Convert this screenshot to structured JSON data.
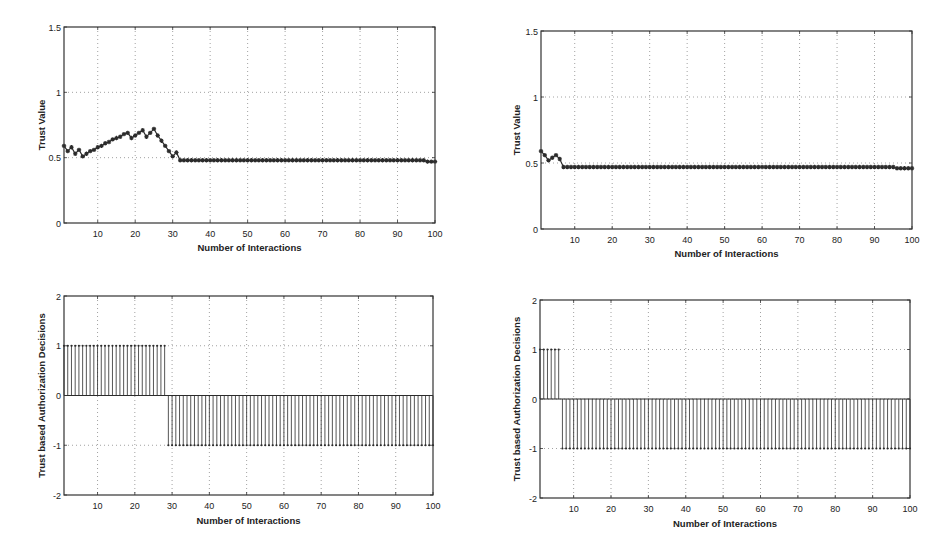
{
  "chart_data": [
    {
      "id": "top_left",
      "type": "line",
      "marker": "asterisk",
      "title": "",
      "xlabel": "Number of Interactions",
      "ylabel": "Trust Value",
      "xlim": [
        1,
        100
      ],
      "ylim": [
        0,
        1.5
      ],
      "xticks": [
        10,
        20,
        30,
        40,
        50,
        60,
        70,
        80,
        90,
        100
      ],
      "yticks": [
        0,
        0.5,
        1,
        1.5
      ],
      "ytick_labels": [
        "0",
        "0.5",
        "1",
        "1.5"
      ],
      "grid": true,
      "x": [
        1,
        2,
        3,
        4,
        5,
        6,
        7,
        8,
        9,
        10,
        11,
        12,
        13,
        14,
        15,
        16,
        17,
        18,
        19,
        20,
        21,
        22,
        23,
        24,
        25,
        26,
        27,
        28,
        29,
        30,
        31,
        32,
        33,
        34,
        35,
        36,
        37,
        38,
        39,
        40,
        41,
        42,
        43,
        44,
        45,
        46,
        47,
        48,
        49,
        50,
        51,
        52,
        53,
        54,
        55,
        56,
        57,
        58,
        59,
        60,
        61,
        62,
        63,
        64,
        65,
        66,
        67,
        68,
        69,
        70,
        71,
        72,
        73,
        74,
        75,
        76,
        77,
        78,
        79,
        80,
        81,
        82,
        83,
        84,
        85,
        86,
        87,
        88,
        89,
        90,
        91,
        92,
        93,
        94,
        95,
        96,
        97,
        98,
        99,
        100
      ],
      "values": [
        0.59,
        0.55,
        0.58,
        0.53,
        0.56,
        0.51,
        0.53,
        0.55,
        0.56,
        0.58,
        0.59,
        0.61,
        0.62,
        0.64,
        0.65,
        0.66,
        0.68,
        0.69,
        0.65,
        0.67,
        0.69,
        0.71,
        0.66,
        0.69,
        0.72,
        0.67,
        0.63,
        0.59,
        0.55,
        0.51,
        0.54,
        0.48,
        0.48,
        0.48,
        0.48,
        0.48,
        0.48,
        0.48,
        0.48,
        0.48,
        0.48,
        0.48,
        0.48,
        0.48,
        0.48,
        0.48,
        0.48,
        0.48,
        0.48,
        0.48,
        0.48,
        0.48,
        0.48,
        0.48,
        0.48,
        0.48,
        0.48,
        0.48,
        0.48,
        0.48,
        0.48,
        0.48,
        0.48,
        0.48,
        0.48,
        0.48,
        0.48,
        0.48,
        0.48,
        0.48,
        0.48,
        0.48,
        0.48,
        0.48,
        0.48,
        0.48,
        0.48,
        0.48,
        0.48,
        0.48,
        0.48,
        0.48,
        0.48,
        0.48,
        0.48,
        0.48,
        0.48,
        0.48,
        0.48,
        0.48,
        0.48,
        0.48,
        0.48,
        0.48,
        0.48,
        0.48,
        0.48,
        0.47,
        0.47,
        0.47
      ]
    },
    {
      "id": "top_right",
      "type": "line",
      "marker": "asterisk",
      "title": "",
      "xlabel": "Number of Interactions",
      "ylabel": "Trust Value",
      "xlim": [
        1,
        100
      ],
      "ylim": [
        0,
        1.5
      ],
      "xticks": [
        10,
        20,
        30,
        40,
        50,
        60,
        70,
        80,
        90,
        100
      ],
      "yticks": [
        0,
        0.5,
        1,
        1.5
      ],
      "ytick_labels": [
        "0",
        "0.5",
        "1",
        "1.5"
      ],
      "grid": true,
      "values": [
        0.59,
        0.56,
        0.52,
        0.54,
        0.56,
        0.53,
        0.47,
        0.47,
        0.47,
        0.47,
        0.47,
        0.47,
        0.47,
        0.47,
        0.47,
        0.47,
        0.47,
        0.47,
        0.47,
        0.47,
        0.47,
        0.47,
        0.47,
        0.47,
        0.47,
        0.47,
        0.47,
        0.47,
        0.47,
        0.47,
        0.47,
        0.47,
        0.47,
        0.47,
        0.47,
        0.47,
        0.47,
        0.47,
        0.47,
        0.47,
        0.47,
        0.47,
        0.47,
        0.47,
        0.47,
        0.47,
        0.47,
        0.47,
        0.47,
        0.47,
        0.47,
        0.47,
        0.47,
        0.47,
        0.47,
        0.47,
        0.47,
        0.47,
        0.47,
        0.47,
        0.47,
        0.47,
        0.47,
        0.47,
        0.47,
        0.47,
        0.47,
        0.47,
        0.47,
        0.47,
        0.47,
        0.47,
        0.47,
        0.47,
        0.47,
        0.47,
        0.47,
        0.47,
        0.47,
        0.47,
        0.47,
        0.47,
        0.47,
        0.47,
        0.47,
        0.47,
        0.47,
        0.47,
        0.47,
        0.47,
        0.47,
        0.47,
        0.47,
        0.47,
        0.47,
        0.46,
        0.46,
        0.46,
        0.46,
        0.46
      ]
    },
    {
      "id": "bottom_left",
      "type": "stem",
      "title": "",
      "xlabel": "Number of Interactions",
      "ylabel": "Trust based Authorization Decisions",
      "xlim": [
        1,
        100
      ],
      "ylim": [
        -2,
        2
      ],
      "xticks": [
        10,
        20,
        30,
        40,
        50,
        60,
        70,
        80,
        90,
        100
      ],
      "yticks": [
        -2,
        -1,
        0,
        1,
        2
      ],
      "ytick_labels": [
        "-2",
        "-1",
        "0",
        "1",
        "2"
      ],
      "grid": true,
      "description": "Decision = 1 for interactions 1-28, -1 for interactions 29-100",
      "positive_until": 28,
      "values": [
        1,
        1,
        1,
        1,
        1,
        1,
        1,
        1,
        1,
        1,
        1,
        1,
        1,
        1,
        1,
        1,
        1,
        1,
        1,
        1,
        1,
        1,
        1,
        1,
        1,
        1,
        1,
        1,
        -1,
        -1,
        -1,
        -1,
        -1,
        -1,
        -1,
        -1,
        -1,
        -1,
        -1,
        -1,
        -1,
        -1,
        -1,
        -1,
        -1,
        -1,
        -1,
        -1,
        -1,
        -1,
        -1,
        -1,
        -1,
        -1,
        -1,
        -1,
        -1,
        -1,
        -1,
        -1,
        -1,
        -1,
        -1,
        -1,
        -1,
        -1,
        -1,
        -1,
        -1,
        -1,
        -1,
        -1,
        -1,
        -1,
        -1,
        -1,
        -1,
        -1,
        -1,
        -1,
        -1,
        -1,
        -1,
        -1,
        -1,
        -1,
        -1,
        -1,
        -1,
        -1,
        -1,
        -1,
        -1,
        -1,
        -1,
        -1,
        -1,
        -1,
        -1,
        -1
      ]
    },
    {
      "id": "bottom_right",
      "type": "stem",
      "title": "",
      "xlabel": "Number of Interactions",
      "ylabel": "Trust based Authorization Decisions",
      "xlim": [
        1,
        100
      ],
      "ylim": [
        -2,
        2
      ],
      "xticks": [
        10,
        20,
        30,
        40,
        50,
        60,
        70,
        80,
        90,
        100
      ],
      "yticks": [
        -2,
        -1,
        0,
        1,
        2
      ],
      "ytick_labels": [
        "-2",
        "-1",
        "0",
        "1",
        "2"
      ],
      "grid": true,
      "description": "Decision = 1 for interactions 1-6, -1 for interactions 7-100",
      "positive_until": 6,
      "values": [
        1,
        1,
        1,
        1,
        1,
        1,
        -1,
        -1,
        -1,
        -1,
        -1,
        -1,
        -1,
        -1,
        -1,
        -1,
        -1,
        -1,
        -1,
        -1,
        -1,
        -1,
        -1,
        -1,
        -1,
        -1,
        -1,
        -1,
        -1,
        -1,
        -1,
        -1,
        -1,
        -1,
        -1,
        -1,
        -1,
        -1,
        -1,
        -1,
        -1,
        -1,
        -1,
        -1,
        -1,
        -1,
        -1,
        -1,
        -1,
        -1,
        -1,
        -1,
        -1,
        -1,
        -1,
        -1,
        -1,
        -1,
        -1,
        -1,
        -1,
        -1,
        -1,
        -1,
        -1,
        -1,
        -1,
        -1,
        -1,
        -1,
        -1,
        -1,
        -1,
        -1,
        -1,
        -1,
        -1,
        -1,
        -1,
        -1,
        -1,
        -1,
        -1,
        -1,
        -1,
        -1,
        -1,
        -1,
        -1,
        -1,
        -1,
        -1,
        -1,
        -1,
        -1,
        -1,
        -1,
        -1,
        -1,
        -1
      ]
    }
  ],
  "panels": [
    {
      "box": {
        "left": 64,
        "top": 27,
        "right": 435,
        "bottom": 223
      },
      "xlabel_y": 251,
      "ylabel_x": 45
    },
    {
      "box": {
        "left": 541,
        "top": 31,
        "right": 912,
        "bottom": 229
      },
      "xlabel_y": 257,
      "ylabel_x": 520
    },
    {
      "box": {
        "left": 64,
        "top": 296,
        "right": 433,
        "bottom": 495
      },
      "xlabel_y": 524,
      "ylabel_x": 45
    },
    {
      "box": {
        "left": 540,
        "top": 300,
        "right": 910,
        "bottom": 498
      },
      "xlabel_y": 527,
      "ylabel_x": 520
    }
  ],
  "colors": {
    "axis": "#333333",
    "grid": "#8a8a8a",
    "series": "#2b2b2b"
  }
}
